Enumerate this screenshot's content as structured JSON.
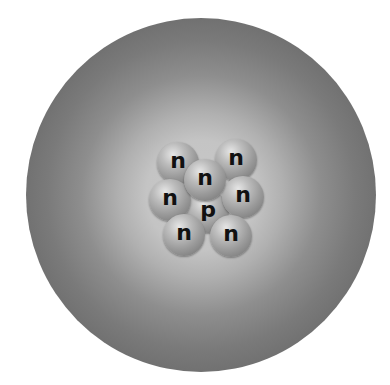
{
  "diagram": {
    "electron_cloud": {
      "shape": "circle",
      "center_color": "#c8c8c8",
      "edge_color": "#3e3e3e"
    },
    "nucleus": {
      "proton_count": 1,
      "neutron_count": 7,
      "particles": [
        {
          "type": "neutron",
          "label": "n",
          "x": 178,
          "y": 163,
          "layer": "neutron"
        },
        {
          "type": "neutron",
          "label": "n",
          "x": 236,
          "y": 160,
          "layer": "neutron"
        },
        {
          "type": "neutron",
          "label": "n",
          "x": 205,
          "y": 180,
          "layer": "front"
        },
        {
          "type": "neutron",
          "label": "n",
          "x": 170,
          "y": 200,
          "layer": "neutron"
        },
        {
          "type": "neutron",
          "label": "n",
          "x": 243,
          "y": 197,
          "layer": "neutron"
        },
        {
          "type": "proton",
          "label": "p",
          "x": 208,
          "y": 212,
          "layer": "proton"
        },
        {
          "type": "neutron",
          "label": "n",
          "x": 184,
          "y": 235,
          "layer": "front"
        },
        {
          "type": "neutron",
          "label": "n",
          "x": 231,
          "y": 236,
          "layer": "front"
        }
      ]
    }
  }
}
